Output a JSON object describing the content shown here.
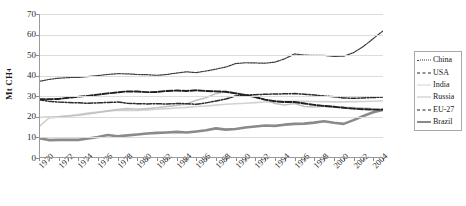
{
  "chart_data": {
    "type": "line",
    "title": "",
    "xlabel": "",
    "ylabel": "Mt CH4",
    "ylabel_html": "Mt CH<sub>4</sub>",
    "xlim": [
      1970,
      2005
    ],
    "ylim": [
      0,
      70
    ],
    "yticks": [
      0,
      10,
      20,
      30,
      40,
      50,
      60,
      70
    ],
    "grid": true,
    "legend_position": "right",
    "x": [
      1970,
      1971,
      1972,
      1973,
      1974,
      1975,
      1976,
      1977,
      1978,
      1979,
      1980,
      1981,
      1982,
      1983,
      1984,
      1985,
      1986,
      1987,
      1988,
      1989,
      1990,
      1991,
      1992,
      1993,
      1994,
      1995,
      1996,
      1997,
      1998,
      1999,
      2000,
      2001,
      2002,
      2003,
      2004,
      2005
    ],
    "xticks": [
      1970,
      1972,
      1974,
      1976,
      1978,
      1980,
      1982,
      1984,
      1986,
      1988,
      1990,
      1992,
      1994,
      1996,
      1998,
      2000,
      2002,
      2004
    ],
    "series": [
      {
        "name": "China",
        "style": "fine-dotted",
        "color": "#3a3a3a",
        "values": [
          37.2,
          38.2,
          38.8,
          39.1,
          39.2,
          39.6,
          40.1,
          40.6,
          41.0,
          40.9,
          40.6,
          40.5,
          40.2,
          40.6,
          41.3,
          41.9,
          41.5,
          42.3,
          43.2,
          44.2,
          45.9,
          46.3,
          46.2,
          46.1,
          46.6,
          48.2,
          50.6,
          50.0,
          49.9,
          49.9,
          49.4,
          49.5,
          51.2,
          54.2,
          58.0,
          61.8
        ]
      },
      {
        "name": "USA",
        "style": "dash-dot",
        "color": "#2b2b2b",
        "values": [
          28.3,
          27.6,
          27.2,
          27.0,
          26.8,
          26.6,
          26.8,
          27.0,
          27.2,
          26.6,
          26.4,
          26.3,
          26.4,
          26.2,
          26.5,
          26.4,
          26.1,
          26.8,
          27.7,
          28.7,
          30.1,
          30.5,
          30.8,
          31.0,
          31.1,
          31.2,
          31.3,
          31.0,
          30.6,
          30.1,
          29.8,
          29.2,
          29.0,
          29.2,
          29.4,
          29.6
        ]
      },
      {
        "name": "India",
        "style": "solid-light",
        "color": "#d2d2d2",
        "values": [
          15.3,
          19.4,
          20.0,
          20.5,
          21.1,
          21.8,
          22.3,
          22.8,
          23.2,
          23.1,
          23.1,
          23.4,
          23.7,
          24.0,
          24.3,
          24.6,
          25.0,
          25.3,
          25.7,
          26.1,
          26.4,
          26.6,
          26.9,
          27.2,
          27.4,
          27.6,
          27.6,
          27.6,
          27.5,
          27.4,
          27.3,
          27.3,
          27.4,
          27.5,
          27.6,
          27.8
        ]
      },
      {
        "name": "Russia",
        "style": "solid-light",
        "color": "#c2c2c2",
        "values": [
          19.7,
          19.9,
          20.0,
          20.4,
          20.8,
          21.4,
          22.1,
          22.9,
          23.6,
          24.0,
          23.7,
          24.0,
          24.4,
          25.0,
          25.6,
          26.3,
          28.1,
          29.3,
          31.3,
          32.3,
          31.7,
          30.8,
          29.5,
          28.2,
          26.5,
          25.8,
          26.5,
          25.0,
          24.8,
          25.2,
          25.0,
          24.6,
          24.5,
          24.3,
          23.9,
          23.5
        ]
      },
      {
        "name": "EU-27",
        "style": "dashed-dark",
        "color": "#1f1f1f",
        "values": [
          28.6,
          28.6,
          28.7,
          29.3,
          29.8,
          30.2,
          30.8,
          31.4,
          31.9,
          32.4,
          32.3,
          32.0,
          32.1,
          32.6,
          32.8,
          32.6,
          32.9,
          32.6,
          32.4,
          32.2,
          31.4,
          30.6,
          29.6,
          28.4,
          27.6,
          27.2,
          27.2,
          26.5,
          25.8,
          25.3,
          24.9,
          24.4,
          24.0,
          23.7,
          23.5,
          23.5
        ]
      },
      {
        "name": "Brazil",
        "style": "solid-thick-gray",
        "color": "#8a8a8a",
        "values": [
          9.7,
          8.7,
          8.8,
          8.9,
          8.8,
          9.5,
          10.2,
          11.2,
          10.6,
          11.0,
          11.4,
          11.9,
          12.2,
          12.4,
          12.7,
          12.4,
          12.9,
          13.5,
          14.4,
          13.8,
          14.1,
          14.8,
          15.3,
          15.8,
          15.6,
          16.2,
          16.6,
          16.7,
          17.2,
          17.9,
          17.1,
          16.6,
          18.4,
          20.4,
          22.2,
          23.4
        ]
      }
    ]
  },
  "legend": {
    "items": [
      {
        "label": "China"
      },
      {
        "label": "USA"
      },
      {
        "label": "India"
      },
      {
        "label": "Russia"
      },
      {
        "label": "EU-27"
      },
      {
        "label": "Brazil"
      }
    ]
  }
}
